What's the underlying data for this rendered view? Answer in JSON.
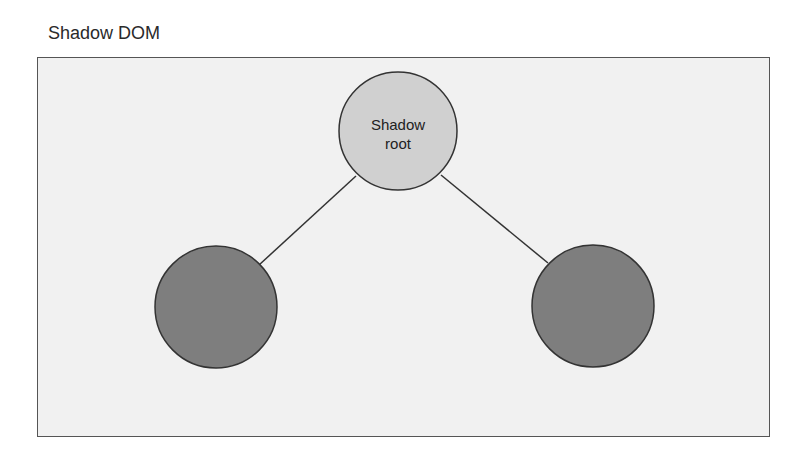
{
  "title": "Shadow DOM",
  "diagram": {
    "root_node": {
      "label_line1": "Shadow",
      "label_line2": "root",
      "fill": "#d0d0d0",
      "stroke": "#333333"
    },
    "child_nodes": [
      {
        "label": "",
        "fill": "#7e7e7e",
        "stroke": "#333333"
      },
      {
        "label": "",
        "fill": "#7e7e7e",
        "stroke": "#333333"
      }
    ],
    "edges": [
      {
        "from": "root",
        "to": "child-left"
      },
      {
        "from": "root",
        "to": "child-right"
      }
    ],
    "background": "#f1f1f1"
  }
}
